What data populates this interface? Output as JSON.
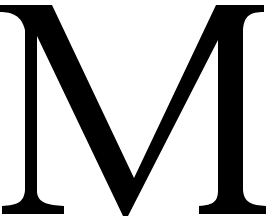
{
  "glyph": {
    "character": "M",
    "style": "serif capital letter",
    "fill_color": "#000000",
    "background_color": "#ffffff"
  }
}
